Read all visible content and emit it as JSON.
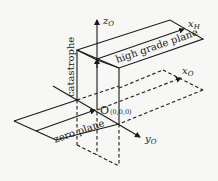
{
  "diagram": {
    "type": "3d-coordinate-planes",
    "labels": {
      "z_axis": "z",
      "z_axis_sub": "O",
      "x_high": "x",
      "x_high_sub": "H",
      "x_zero": "x",
      "x_zero_sub": "O",
      "y_axis": "y",
      "y_axis_sub": "O",
      "origin": "O",
      "origin_coords": "(0,0,0)",
      "catastrophe": "catastrophe",
      "high_plane": "high grade plane",
      "zero_plane": "zero plane"
    },
    "colors": {
      "ink": "#1a1a1a",
      "background": "#f7f7f5"
    }
  }
}
